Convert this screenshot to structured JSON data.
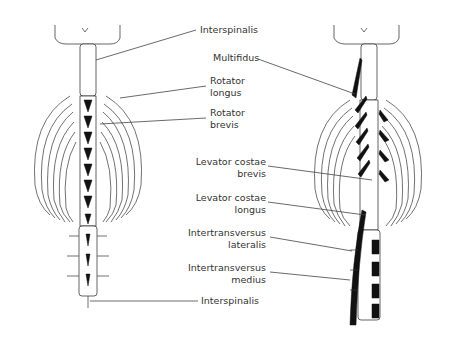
{
  "diagram": {
    "left_figure": {
      "labels": [
        {
          "id": "interspinalis-top",
          "text": "Interspinalis"
        },
        {
          "id": "rotator-longus",
          "line1": "Rotator",
          "line2": "longus"
        },
        {
          "id": "rotator-brevis",
          "line1": "Rotator",
          "line2": "brevis"
        },
        {
          "id": "interspinalis-bottom",
          "text": "Interspinalis"
        }
      ]
    },
    "right_figure": {
      "labels": [
        {
          "id": "multifidus",
          "text": "Multifidus"
        },
        {
          "id": "levator-costae-brevis",
          "line1": "Levator costae",
          "line2": "brevis"
        },
        {
          "id": "levator-costae-longus",
          "line1": "Levator costae",
          "line2": "longus"
        },
        {
          "id": "intertransversus-lateralis",
          "line1": "Intertransversus",
          "line2": "lateralis"
        },
        {
          "id": "intertransversus-medius",
          "line1": "Intertransversus",
          "line2": "medius"
        }
      ]
    }
  }
}
